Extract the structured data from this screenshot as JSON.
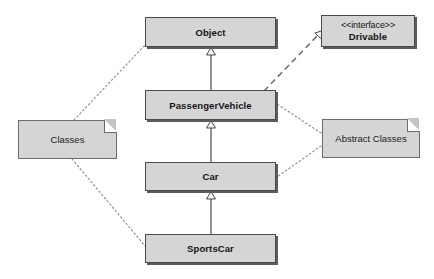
{
  "diagram": {
    "type": "uml-class-diagram",
    "background_color": "#ffffff",
    "node_fill_color": "#d5d5d5",
    "node_border_color": "#4a4a4a",
    "shadow_color": "#5c5c5c",
    "text_color": "#141414"
  },
  "nodes": {
    "object": {
      "label": "Object",
      "kind": "class",
      "x": 145,
      "y": 17,
      "w": 131,
      "h": 30
    },
    "drivable": {
      "stereotype": "<<interface>>",
      "label": "Drivable",
      "kind": "interface",
      "x": 321,
      "y": 15,
      "w": 94,
      "h": 32
    },
    "passenger_vehicle": {
      "label": "PassengerVehicle",
      "kind": "class",
      "x": 145,
      "y": 90,
      "w": 131,
      "h": 30
    },
    "car": {
      "label": "Car",
      "kind": "class",
      "x": 145,
      "y": 162,
      "w": 131,
      "h": 29
    },
    "sportscar": {
      "label": "SportsCar",
      "kind": "class",
      "x": 145,
      "y": 234,
      "w": 131,
      "h": 29
    }
  },
  "notes": {
    "classes_note": {
      "label": "Classes",
      "kind": "note",
      "x": 18,
      "y": 120,
      "w": 99,
      "h": 39
    },
    "abstract_classes_note": {
      "label": "Abstract Classes",
      "kind": "note",
      "x": 322,
      "y": 119,
      "w": 98,
      "h": 39
    }
  },
  "edges": [
    {
      "name": "generalization-passengervehicle-to-object",
      "from": "passenger_vehicle",
      "to": "object",
      "style": "solid",
      "arrow": "hollow-triangle",
      "relationship": "generalization"
    },
    {
      "name": "generalization-car-to-passengervehicle",
      "from": "car",
      "to": "passenger_vehicle",
      "style": "solid",
      "arrow": "hollow-triangle",
      "relationship": "generalization"
    },
    {
      "name": "generalization-sportscar-to-car",
      "from": "sportscar",
      "to": "car",
      "style": "solid",
      "arrow": "hollow-triangle",
      "relationship": "generalization"
    },
    {
      "name": "realization-passengervehicle-to-drivable",
      "from": "passenger_vehicle",
      "to": "drivable",
      "style": "dashed",
      "arrow": "hollow-triangle",
      "relationship": "realization"
    },
    {
      "name": "note-anchor-classes-to-object",
      "from": "classes_note",
      "to": "object",
      "style": "dotted",
      "arrow": "none",
      "relationship": "note-anchor"
    },
    {
      "name": "note-anchor-classes-to-sportscar",
      "from": "classes_note",
      "to": "sportscar",
      "style": "dotted",
      "arrow": "none",
      "relationship": "note-anchor"
    },
    {
      "name": "note-anchor-abstract-to-passengervehicle",
      "from": "abstract_classes_note",
      "to": "passenger_vehicle",
      "style": "dotted",
      "arrow": "none",
      "relationship": "note-anchor"
    },
    {
      "name": "note-anchor-abstract-to-car",
      "from": "abstract_classes_note",
      "to": "car",
      "style": "dotted",
      "arrow": "none",
      "relationship": "note-anchor"
    }
  ]
}
